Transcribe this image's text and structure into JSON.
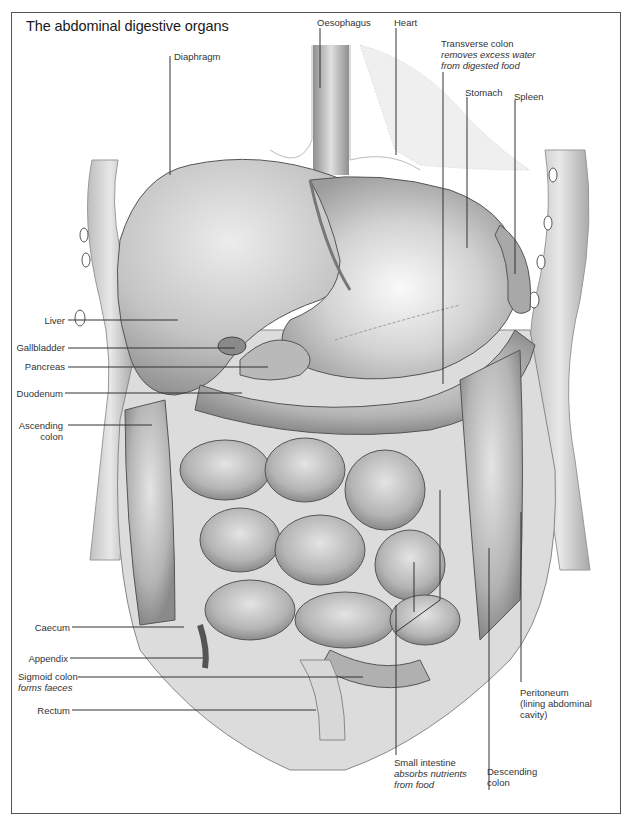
{
  "title": "The abdominal digestive organs",
  "labels": {
    "diaphragm": {
      "name": "Diaphragm"
    },
    "oesophagus": {
      "name": "Oesophagus"
    },
    "heart": {
      "name": "Heart"
    },
    "transverse_colon": {
      "name": "Transverse colon",
      "note1": "removes excess water",
      "note2": "from digested food"
    },
    "stomach": {
      "name": "Stomach"
    },
    "spleen": {
      "name": "Spleen"
    },
    "liver": {
      "name": "Liver"
    },
    "gallbladder": {
      "name": "Gallbladder"
    },
    "pancreas": {
      "name": "Pancreas"
    },
    "duodenum": {
      "name": "Duodenum"
    },
    "ascending_colon": {
      "line1": "Ascending",
      "line2": "colon"
    },
    "caecum": {
      "name": "Caecum"
    },
    "appendix": {
      "name": "Appendix"
    },
    "sigmoid_colon": {
      "name": "Sigmoid colon",
      "note": "forms faeces"
    },
    "rectum": {
      "name": "Rectum"
    },
    "small_intestine": {
      "name": "Small intestine",
      "note1": "absorbs nutrients",
      "note2": "from food"
    },
    "descending_colon": {
      "line1": "Descending",
      "line2": "colon"
    },
    "peritoneum": {
      "line1": "Peritoneum",
      "line2": "(lining abdominal",
      "line3": "cavity)"
    }
  },
  "colors": {
    "ink": "#333333",
    "organ_fill": "#c9c9c9",
    "organ_dark": "#9a9a9a",
    "organ_light": "#e6e6e6",
    "frame": "#555555"
  }
}
